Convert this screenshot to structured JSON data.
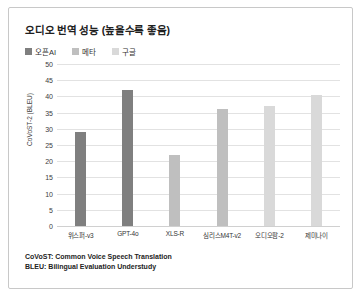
{
  "card": {
    "title": "오디오 번역 성능 (높을수록 좋음)"
  },
  "legend": {
    "items": [
      {
        "label": "오픈AI",
        "color": "#7f7f7f"
      },
      {
        "label": "메타",
        "color": "#bfbfbf"
      },
      {
        "label": "구글",
        "color": "#d9d9d9"
      }
    ]
  },
  "footnotes": [
    "CoVoST: Common Voice Speech Translation",
    "BLEU: Bilingual Evaluation Understudy"
  ],
  "chart_data": {
    "type": "bar",
    "title": "오디오 번역 성능 (높을수록 좋음)",
    "xlabel": "",
    "ylabel": "CoVoST-2 (BLEU)",
    "ylim": [
      0,
      50
    ],
    "ytick_step": 5,
    "yticks": [
      50,
      45,
      40,
      35,
      30,
      25,
      20,
      15,
      10,
      5,
      0
    ],
    "grid": true,
    "legend_position": "top-left",
    "categories": [
      "위스퍼-v3",
      "GPT-4o",
      "XLS-R",
      "심리스M4T-v2",
      "오디오팜-2",
      "제미나이"
    ],
    "values": [
      29,
      42,
      22,
      36,
      37,
      40.5
    ],
    "bar_colors": [
      "#7f7f7f",
      "#7f7f7f",
      "#bfbfbf",
      "#bfbfbf",
      "#d9d9d9",
      "#d9d9d9"
    ],
    "series": [
      {
        "name": "오픈AI",
        "points": [
          {
            "category": "위스퍼-v3",
            "value": 29
          },
          {
            "category": "GPT-4o",
            "value": 42
          }
        ]
      },
      {
        "name": "메타",
        "points": [
          {
            "category": "XLS-R",
            "value": 22
          },
          {
            "category": "심리스M4T-v2",
            "value": 36
          }
        ]
      },
      {
        "name": "구글",
        "points": [
          {
            "category": "오디오팜-2",
            "value": 37
          },
          {
            "category": "제미나이",
            "value": 40.5
          }
        ]
      }
    ]
  }
}
